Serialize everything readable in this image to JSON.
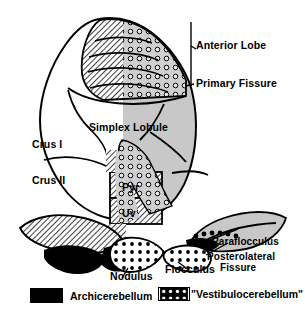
{
  "figure": {
    "background_color": "#ffffff",
    "shaded_hemisphere_color": "#c8c8c8",
    "outline_color": "#000000"
  },
  "labels": {
    "anterior_lobe": "Anterior Lobe",
    "primary_fissure": "Primary Fissure",
    "simplex_lobule": "Simplex Lobule",
    "crus_i": "Crus I",
    "crus_ii": "Crus II",
    "pyramis": "Pyr",
    "uvula": "Uv",
    "paraflocculus": "Paraflocculus",
    "posterolateral": "Posterolateral",
    "fissure": "Fissure",
    "nodulus": "Nodulus",
    "flocculus": "Flocculus"
  },
  "legend": {
    "items": [
      {
        "label": "Archicerebellum",
        "pattern": "solid-black"
      },
      {
        "label": "\"Vestibulocerebellum\"",
        "pattern": "black-with-white-dots"
      }
    ]
  }
}
